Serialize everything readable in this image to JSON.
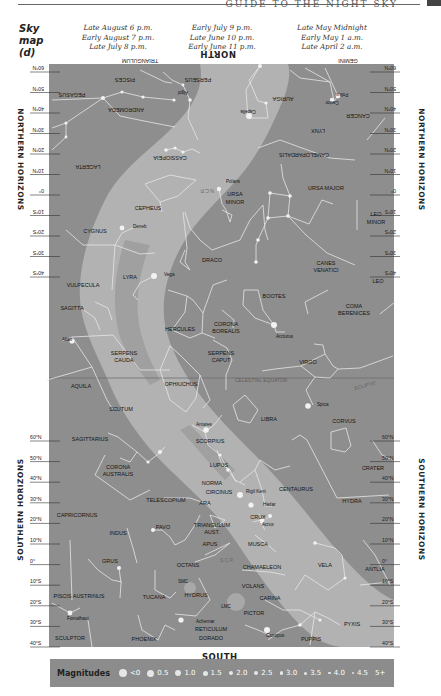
{
  "header": {
    "running_title": "GUIDE TO THE NIGHT SKY",
    "sky_label": [
      "Sky",
      "map",
      "(d)"
    ],
    "time_columns": [
      [
        "Late August 6 p.m.",
        "Early August 7 p.m.",
        "Late July 8 p.m."
      ],
      [
        "Early July 9 p.m.",
        "Late June 10 p.m.",
        "Early June 11 p.m."
      ],
      [
        "Late May Midnight",
        "Early May 1 a.m.",
        "Late April 2 a.m."
      ]
    ]
  },
  "map": {
    "north_label": "NORTH",
    "south_label": "SOUTH",
    "horizons": {
      "northern_left": "NORTHERN HORIZONS",
      "northern_right": "NORTHERN HORIZONS",
      "southern_left": "SOUTHERN HORIZONS",
      "southern_right": "SOUTHERN HORIZONS"
    },
    "north_lat_ticks": [
      "60°N",
      "50°N",
      "40°N",
      "30°N",
      "20°N",
      "10°N",
      "0°",
      "10°S",
      "20°S",
      "30°S",
      "40°S"
    ],
    "south_lat_ticks": [
      "60°N",
      "50°N",
      "40°N",
      "30°N",
      "20°N",
      "10°N",
      "0°",
      "10°S",
      "20°S",
      "30°S",
      "40°S"
    ],
    "colors": {
      "sky": "#8e8e8e",
      "milky_way": "#b4b4b4",
      "milky_way_dark": "#a2a2a2",
      "lines": "#e8e8e8",
      "stars": "#f0f0f0",
      "label": "#111111"
    },
    "lines": {
      "celestial_equator": "CELESTIAL EQUATOR",
      "ecliptic": "ECLIPTIC",
      "ncp": "N.C.P.",
      "scp": "S.C.P."
    },
    "constellations_inverted": [
      {
        "name": "TRIANGULUM",
        "x": 140,
        "y": 61
      },
      {
        "name": "GEMINI",
        "x": 348,
        "y": 61
      },
      {
        "name": "PISCES",
        "x": 125,
        "y": 80
      },
      {
        "name": "PERSEUS",
        "x": 198,
        "y": 80
      },
      {
        "name": "PEGASUS",
        "x": 72,
        "y": 95
      },
      {
        "name": "AURIGA",
        "x": 283,
        "y": 99
      },
      {
        "name": "ANDROMEDA",
        "x": 126,
        "y": 110
      },
      {
        "name": "CANCER",
        "x": 358,
        "y": 116
      },
      {
        "name": "LYNX",
        "x": 318,
        "y": 131
      },
      {
        "name": "CAMELOPARDALIS",
        "x": 304,
        "y": 155
      },
      {
        "name": "CASSIOPEIA",
        "x": 170,
        "y": 158
      },
      {
        "name": "LACERTA",
        "x": 88,
        "y": 167
      }
    ],
    "stars_inverted": [
      {
        "name": "Algol",
        "x": 183,
        "y": 93
      },
      {
        "name": "Capella",
        "x": 248,
        "y": 112
      },
      {
        "name": "Castor",
        "x": 332,
        "y": 103
      },
      {
        "name": "Pollux",
        "x": 342,
        "y": 95
      }
    ],
    "constellations": [
      {
        "name": "URSA MAJOR",
        "x": 326,
        "y": 190
      },
      {
        "name": "URSA",
        "x": 235,
        "y": 196
      },
      {
        "name": "MINOR",
        "x": 235,
        "y": 204
      },
      {
        "name": "CEPHEUS",
        "x": 148,
        "y": 210
      },
      {
        "name": "LEO",
        "x": 376,
        "y": 216
      },
      {
        "name": "MINOR",
        "x": 376,
        "y": 224
      },
      {
        "name": "CYGNUS",
        "x": 95,
        "y": 233
      },
      {
        "name": "DRACO",
        "x": 212,
        "y": 262
      },
      {
        "name": "CANES",
        "x": 326,
        "y": 265
      },
      {
        "name": "VENATICI",
        "x": 326,
        "y": 272
      },
      {
        "name": "LYRA",
        "x": 130,
        "y": 279
      },
      {
        "name": "VULPECULA",
        "x": 83,
        "y": 287
      },
      {
        "name": "LEO",
        "x": 378,
        "y": 283
      },
      {
        "name": "BOOTES",
        "x": 274,
        "y": 298
      },
      {
        "name": "SAGITTA",
        "x": 72,
        "y": 310
      },
      {
        "name": "COMA",
        "x": 354,
        "y": 308
      },
      {
        "name": "BERENICES",
        "x": 354,
        "y": 315
      },
      {
        "name": "HERCULES",
        "x": 180,
        "y": 331
      },
      {
        "name": "CORONA",
        "x": 226,
        "y": 326
      },
      {
        "name": "BOREALIS",
        "x": 226,
        "y": 333
      },
      {
        "name": "SERPENS",
        "x": 124,
        "y": 355
      },
      {
        "name": "CAUDA",
        "x": 124,
        "y": 362
      },
      {
        "name": "SERPENS",
        "x": 221,
        "y": 355
      },
      {
        "name": "CAPUT",
        "x": 221,
        "y": 362
      },
      {
        "name": "VIRGO",
        "x": 308,
        "y": 364
      },
      {
        "name": "AQUILA",
        "x": 81,
        "y": 388
      },
      {
        "name": "OPHIUCHUS",
        "x": 181,
        "y": 386
      },
      {
        "name": "SCUTUM",
        "x": 121,
        "y": 411
      },
      {
        "name": "LIBRA",
        "x": 269,
        "y": 421
      },
      {
        "name": "CORVUS",
        "x": 344,
        "y": 423
      },
      {
        "name": "SAGITTARIUS",
        "x": 90,
        "y": 441
      },
      {
        "name": "SCORPIUS",
        "x": 210,
        "y": 443
      },
      {
        "name": "CRATER",
        "x": 373,
        "y": 470
      },
      {
        "name": "CORONA",
        "x": 118,
        "y": 469
      },
      {
        "name": "AUSTRALIS",
        "x": 118,
        "y": 476
      },
      {
        "name": "LUPUS",
        "x": 219,
        "y": 467
      },
      {
        "name": "NORMA",
        "x": 212,
        "y": 485
      },
      {
        "name": "CIRCINUS",
        "x": 219,
        "y": 494
      },
      {
        "name": "CENTAURUS",
        "x": 296,
        "y": 491
      },
      {
        "name": "TELESCOPIUM",
        "x": 166,
        "y": 502
      },
      {
        "name": "ARA",
        "x": 205,
        "y": 505
      },
      {
        "name": "HYDRA",
        "x": 352,
        "y": 503
      },
      {
        "name": "CAPRICORNUS",
        "x": 77,
        "y": 517
      },
      {
        "name": "CRUX",
        "x": 258,
        "y": 519
      },
      {
        "name": "TRIANGULUM",
        "x": 212,
        "y": 527
      },
      {
        "name": "AUST.",
        "x": 212,
        "y": 534
      },
      {
        "name": "PAVO",
        "x": 163,
        "y": 529
      },
      {
        "name": "INDUS",
        "x": 118,
        "y": 535
      },
      {
        "name": "APUS",
        "x": 210,
        "y": 546
      },
      {
        "name": "MUSCA",
        "x": 258,
        "y": 546
      },
      {
        "name": "OCTANS",
        "x": 188,
        "y": 567
      },
      {
        "name": "CHAMAELEON",
        "x": 262,
        "y": 569
      },
      {
        "name": "GRUS",
        "x": 110,
        "y": 563
      },
      {
        "name": "VELA",
        "x": 325,
        "y": 567
      },
      {
        "name": "ANTLIA",
        "x": 375,
        "y": 571
      },
      {
        "name": "VOLANS",
        "x": 253,
        "y": 588
      },
      {
        "name": "TUCANA",
        "x": 154,
        "y": 599
      },
      {
        "name": "HYDRUS",
        "x": 196,
        "y": 597
      },
      {
        "name": "PISCIS AUSTRINUS",
        "x": 79,
        "y": 598
      },
      {
        "name": "CARINA",
        "x": 270,
        "y": 600
      },
      {
        "name": "PICTOR",
        "x": 254,
        "y": 615
      },
      {
        "name": "PYXIS",
        "x": 352,
        "y": 626
      },
      {
        "name": "RETICULUM",
        "x": 211,
        "y": 631
      },
      {
        "name": "DORADO",
        "x": 211,
        "y": 640
      },
      {
        "name": "SCULPTOR",
        "x": 70,
        "y": 640
      },
      {
        "name": "PHOENIX",
        "x": 144,
        "y": 641
      },
      {
        "name": "PUPPIS",
        "x": 311,
        "y": 641
      }
    ],
    "named_stars": [
      {
        "name": "Polaris",
        "x": 226,
        "y": 183
      },
      {
        "name": "Deneb",
        "x": 133,
        "y": 228
      },
      {
        "name": "Vega",
        "x": 164,
        "y": 276
      },
      {
        "name": "Arcturus",
        "x": 276,
        "y": 338
      },
      {
        "name": "Altair",
        "x": 62,
        "y": 341
      },
      {
        "name": "Spica",
        "x": 317,
        "y": 406
      },
      {
        "name": "Antares",
        "x": 196,
        "y": 426
      },
      {
        "name": "Rigil Kent",
        "x": 246,
        "y": 493
      },
      {
        "name": "Hadar",
        "x": 263,
        "y": 506
      },
      {
        "name": "Acrux",
        "x": 262,
        "y": 526
      },
      {
        "name": "Fomalhaut",
        "x": 67,
        "y": 620
      },
      {
        "name": "Achernar",
        "x": 196,
        "y": 623
      },
      {
        "name": "Canopus",
        "x": 266,
        "y": 637
      }
    ],
    "clouds": [
      {
        "name": "SMC",
        "x": 183,
        "y": 583
      },
      {
        "name": "LMC",
        "x": 226,
        "y": 608
      }
    ]
  },
  "legend": {
    "title": "Magnitudes",
    "items": [
      {
        "label": "<0",
        "size": 8
      },
      {
        "label": "0.5",
        "size": 7
      },
      {
        "label": "1.0",
        "size": 6
      },
      {
        "label": "1.5",
        "size": 5
      },
      {
        "label": "2.0",
        "size": 4.5
      },
      {
        "label": "2.5",
        "size": 4
      },
      {
        "label": "3.0",
        "size": 3.5
      },
      {
        "label": "3.5",
        "size": 3
      },
      {
        "label": "4.0",
        "size": 2.5
      },
      {
        "label": "4.5",
        "size": 2
      },
      {
        "label": "5+",
        "size": 0
      }
    ]
  }
}
